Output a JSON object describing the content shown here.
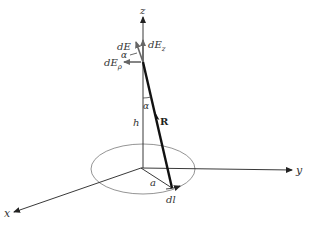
{
  "diagram": {
    "axes": {
      "x_label": "x",
      "y_label": "y",
      "z_label": "z"
    },
    "vectors": {
      "R_label": "R",
      "dE_label": "dE",
      "dEz_label_main": "dE",
      "dEz_label_sub": "z",
      "dEp_label_main": "dE",
      "dEp_label_sub": "ρ"
    },
    "quantities": {
      "height_label": "h",
      "radius_label": "a",
      "element_label": "dl",
      "angle_label_top": "α",
      "angle_label_field": "α"
    },
    "colors": {
      "line": "#222222",
      "ellipse": "#888888",
      "arrow_gray": "#666666"
    }
  }
}
